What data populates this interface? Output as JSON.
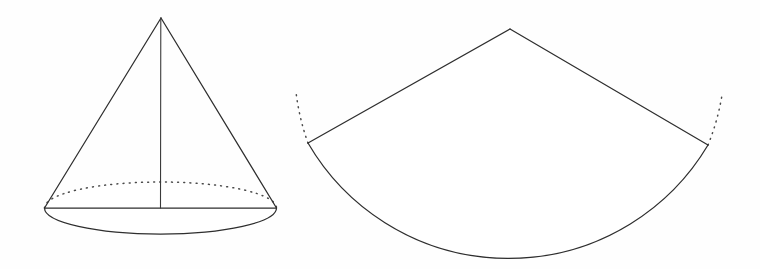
{
  "figure": {
    "background_color": "#fefefe",
    "stroke_color": "#2e2e2e",
    "dotted_stroke_color": "#4a4a4a",
    "fill_color": "#ffffff",
    "width": 760,
    "height": 269
  },
  "cone": {
    "label": "cone",
    "apex": {
      "x": 161,
      "y": 18
    },
    "base_center": {
      "x": 160.5,
      "y": 208
    },
    "base_radius_x": 116,
    "base_radius_y": 26,
    "left_base_point": {
      "x": 44.5,
      "y": 208
    },
    "right_base_point": {
      "x": 276.5,
      "y": 208
    },
    "base_bottom_point": {
      "x": 160.5,
      "y": 234
    },
    "base_top_point": {
      "x": 160.5,
      "y": 182
    },
    "axis_label": "axis",
    "slant_left_label": "left slant edge",
    "slant_right_label": "right slant edge",
    "base_front_arc_label": "base front arc (solid)",
    "base_back_arc_label": "base back arc (hidden, dotted)",
    "base_diameter_label": "base diameter",
    "height_px": 190,
    "paths": {
      "slant_left": "M 161 18 L 44.5 208",
      "slant_right": "M 161 18 L 276.5 208",
      "axis": "M 160.8 18 L 160.5 208",
      "base_diameter": "M 44.5 208 L 276.5 208",
      "base_front_arc": "M 44.5 208 A 116 26 0 0 0 276.5 208",
      "base_back_arc": "M 44.5 208 A 116 26 0 0 1 276.5 208"
    }
  },
  "sector": {
    "label": "circular sector (unrolled lateral surface)",
    "apex": {
      "x": 510,
      "y": 29
    },
    "radius": 224,
    "left_corner": {
      "x": 308,
      "y": 143
    },
    "right_corner": {
      "x": 708,
      "y": 145
    },
    "arc_bottom_point": {
      "x": 512,
      "y": 253
    },
    "radius_left_label": "left radius edge",
    "radius_right_label": "right radius edge",
    "arc_label": "sector arc (solid)",
    "dotted_left_label": "left dotted arc extension",
    "dotted_right_label": "right dotted arc extension",
    "paths": {
      "outline": "M 510 29 L 308 143 A 232 232 0 0 0 708 145 Z",
      "radius_left": "M 510 29 L 308 143",
      "radius_right": "M 510 29 L 708 145",
      "arc": "M 308 143 A 232 232 0 0 0 708 145",
      "dotted_left": "M 308 143 A 232 232 0 0 1 296 92",
      "dotted_right": "M 708 145 A 232 232 0 0 0 722 95"
    }
  }
}
